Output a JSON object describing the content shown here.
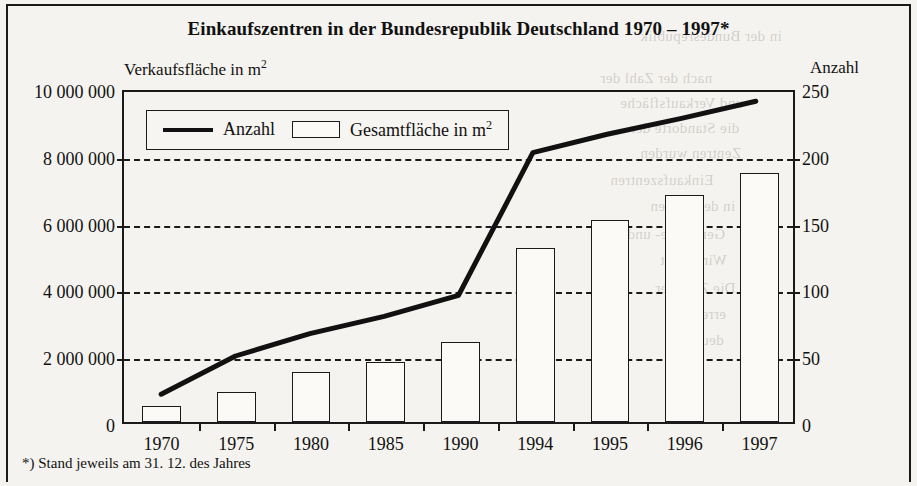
{
  "figure": {
    "title": "Einkaufszentren in der Bundesrepublik Deutschland 1970 – 1997*",
    "footnote": "*) Stand jeweils am 31. 12. des Jahres",
    "left_axis_title": "Verkaufsfläche in m²",
    "right_axis_title": "Anzahl"
  },
  "legend": {
    "line_label": "Anzahl",
    "bar_label": "Gesamtfläche in m²"
  },
  "chart_data": {
    "type": "bar",
    "title": "Einkaufszentren in der Bundesrepublik Deutschland 1970 – 1997*",
    "xlabel": "",
    "ylabel": "Verkaufsfläche in m²",
    "y2label": "Anzahl",
    "categories": [
      "1970",
      "1975",
      "1980",
      "1985",
      "1990",
      "1994",
      "1995",
      "1996",
      "1997"
    ],
    "ylim": [
      0,
      10000000
    ],
    "y2lim": [
      0,
      250
    ],
    "yticks": [
      "0",
      "2 000 000",
      "4 000 000",
      "6 000 000",
      "8 000 000",
      "10 000 000"
    ],
    "ytick_values": [
      0,
      2000000,
      4000000,
      6000000,
      8000000,
      10000000
    ],
    "y2ticks": [
      "0",
      "50",
      "100",
      "150",
      "200",
      "250"
    ],
    "y2tick_values": [
      0,
      50,
      100,
      150,
      200,
      250
    ],
    "grid": true,
    "legend_position": "upper left inside plot",
    "series": [
      {
        "name": "Gesamtfläche in m²",
        "type": "bar",
        "axis": "left",
        "values": [
          480000,
          900000,
          1500000,
          1800000,
          2400000,
          5200000,
          6050000,
          6800000,
          7450000
        ]
      },
      {
        "name": "Anzahl",
        "type": "line",
        "axis": "right",
        "values": [
          21,
          50,
          67,
          80,
          96,
          204,
          218,
          230,
          243
        ]
      }
    ]
  },
  "bleed_text": [
    {
      "t": "in der Bundesrepublik",
      "x": 640,
      "y": 28
    },
    {
      "t": "nach der Zahl der",
      "x": 600,
      "y": 70
    },
    {
      "t": "und Verkaufsfläche",
      "x": 620,
      "y": 95
    },
    {
      "t": "die Standorte der",
      "x": 630,
      "y": 120
    },
    {
      "t": "Zentren wurden",
      "x": 640,
      "y": 145
    },
    {
      "t": "Einkaufszentren",
      "x": 610,
      "y": 172
    },
    {
      "t": "in den Jahren",
      "x": 650,
      "y": 198
    },
    {
      "t": "Gemeinde- und Stadt",
      "x": 590,
      "y": 226
    },
    {
      "t": "Wirtschaft",
      "x": 660,
      "y": 252
    },
    {
      "t": "Die Zahl der",
      "x": 655,
      "y": 280
    },
    {
      "t": "erreichte",
      "x": 670,
      "y": 306
    },
    {
      "t": "deutsch",
      "x": 675,
      "y": 332
    }
  ]
}
